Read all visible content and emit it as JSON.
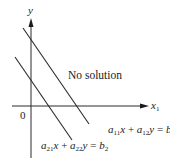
{
  "diagram": {
    "axes": {
      "y_label": "y",
      "x_label": "x",
      "x_label_sub": "1",
      "origin_label": "0"
    },
    "region_label": "No solution",
    "equations": [
      {
        "a1": "a",
        "a1_sub": "11",
        "v1": "x",
        "plus": "+",
        "a2": "a",
        "a2_sub": "12",
        "v2": "y",
        "eq": "=",
        "b": "b",
        "b_sub": "1"
      },
      {
        "a1": "a",
        "a1_sub": "21",
        "v1": "x",
        "plus": "+",
        "a2": "a",
        "a2_sub": "22",
        "v2": "y",
        "eq": "=",
        "b": "b",
        "b_sub": "2"
      }
    ],
    "colors": {
      "line": "#2a2a2a",
      "text": "#1a1a1a",
      "background": "#ffffff"
    }
  }
}
